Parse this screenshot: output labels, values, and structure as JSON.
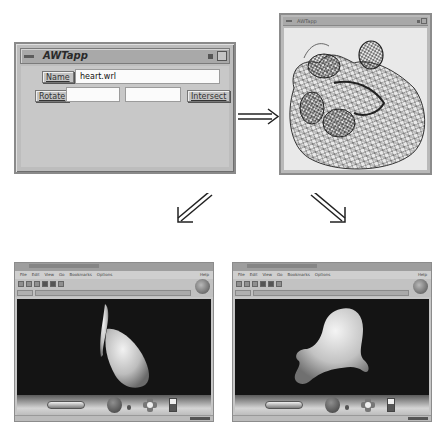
{
  "awtapp": {
    "title": "AWTapp",
    "name_button": "Name",
    "name_value": "heart.wrl",
    "rotate_button": "Rotate",
    "rotate_field_1": "",
    "rotate_field_2": "",
    "intersect_button": "Intersect"
  },
  "wireframe_window": {
    "title": "AWTapp",
    "content": "wireframe heart model"
  },
  "arrows": {
    "right": "⇒",
    "down_left": "⇙",
    "down_right": "⇘"
  },
  "browser_left": {
    "menus": [
      "File",
      "Edit",
      "View",
      "Go",
      "Bookmarks",
      "Options"
    ],
    "help": "Help",
    "scene": "shaded heart model, side view",
    "background": "#141414"
  },
  "browser_right": {
    "menus": [
      "File",
      "Edit",
      "View",
      "Go",
      "Bookmarks",
      "Options"
    ],
    "help": "Help",
    "scene": "shaded heart model, rotated view",
    "background": "#141414"
  },
  "colors": {
    "window_gray": "#bdbdbd",
    "field_white": "#fbfbfb",
    "scene_black": "#141414",
    "model_gray": "#d9d9d9"
  }
}
